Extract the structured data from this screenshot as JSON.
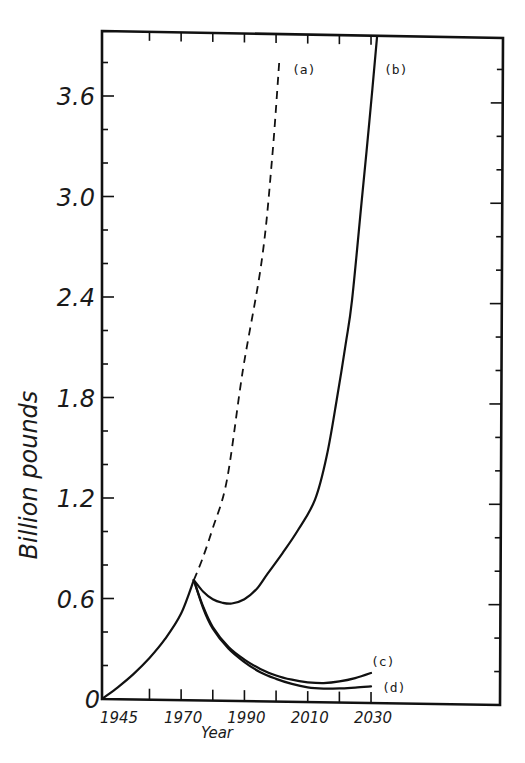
{
  "chart_data": {
    "type": "line",
    "title": "",
    "xlabel": "Year",
    "ylabel": "Billion pounds",
    "xlim": [
      1945,
      2070
    ],
    "ylim": [
      0,
      4.0
    ],
    "grid": false,
    "legend": "inline labels at line ends",
    "x_tick_labels": [
      {
        "value": 1945,
        "label": "1945"
      },
      {
        "value": 1970,
        "label": "1970"
      },
      {
        "value": 1990,
        "label": "1990"
      },
      {
        "value": 2010,
        "label": "2010"
      },
      {
        "value": 2030,
        "label": "2030"
      }
    ],
    "x_ticks": [
      1960,
      1970,
      1980,
      1990,
      2000,
      2010,
      2020,
      2030
    ],
    "y_tick_labels": [
      {
        "value": 0,
        "label": "0"
      },
      {
        "value": 0.6,
        "label": "0.6"
      },
      {
        "value": 1.2,
        "label": "1.2"
      },
      {
        "value": 1.8,
        "label": "1.8"
      },
      {
        "value": 2.4,
        "label": "2.4"
      },
      {
        "value": 3.0,
        "label": "3.0"
      },
      {
        "value": 3.6,
        "label": "3.6"
      }
    ],
    "y_minor_step": 0.2,
    "series": [
      {
        "name": "(a)",
        "style": "dashed",
        "x": [
          1945,
          1950,
          1955,
          1960,
          1965,
          1970,
          1974,
          1976.6,
          1980,
          1984.5,
          1989.5,
          1995.5,
          1998.7,
          2001
        ],
        "values": [
          0,
          0.07,
          0.15,
          0.245,
          0.36,
          0.51,
          0.71,
          0.83,
          1.02,
          1.31,
          1.96,
          2.62,
          3.22,
          3.8
        ],
        "label_pos": {
          "x": 2003.5,
          "y": 3.77
        }
      },
      {
        "name": "(b)",
        "style": "solid",
        "x": [
          1945,
          1950,
          1955,
          1960,
          1965,
          1970,
          1974,
          1977,
          1980,
          1983,
          1986,
          1990,
          1994,
          1997.4,
          2002,
          2007,
          2012.3,
          2016,
          2019.2,
          2022,
          2024,
          2027.1,
          2029.5,
          2031.9
        ],
        "values": [
          0,
          0.07,
          0.15,
          0.245,
          0.36,
          0.51,
          0.71,
          0.64,
          0.595,
          0.575,
          0.57,
          0.595,
          0.66,
          0.75,
          0.87,
          1.01,
          1.19,
          1.45,
          1.79,
          2.12,
          2.38,
          2.98,
          3.45,
          3.95
        ],
        "label_pos": {
          "x": 2034,
          "y": 3.77
        }
      },
      {
        "name": "(c)",
        "style": "solid",
        "x": [
          1974,
          1977,
          1980,
          1985,
          1990,
          1995,
          2000,
          2005,
          2010,
          2015,
          2020,
          2025,
          2030
        ],
        "values": [
          0.71,
          0.55,
          0.43,
          0.31,
          0.235,
          0.18,
          0.14,
          0.115,
          0.1,
          0.095,
          0.105,
          0.125,
          0.155
        ],
        "label_pos": {
          "x": 2031.5,
          "y": 0.2
        }
      },
      {
        "name": "(d)",
        "style": "solid",
        "x": [
          1974,
          1977,
          1980,
          1985,
          1990,
          1995,
          2000,
          2005,
          2010,
          2015,
          2020,
          2025,
          2030
        ],
        "values": [
          0.71,
          0.54,
          0.42,
          0.3,
          0.22,
          0.16,
          0.12,
          0.09,
          0.07,
          0.062,
          0.063,
          0.068,
          0.075
        ],
        "label_pos": {
          "x": 2032.5,
          "y": 0.07
        }
      }
    ],
    "annotations": [
      {
        "text": "0",
        "note": "origin label"
      }
    ]
  },
  "labels": {
    "y_axis_title": "Billion pounds",
    "x_axis_title": "Year",
    "series_a": "(a)",
    "series_b": "(b)",
    "series_c": "(c)",
    "series_d": "(d)"
  },
  "colors": {
    "ink": "#111111",
    "background": "#ffffff"
  }
}
